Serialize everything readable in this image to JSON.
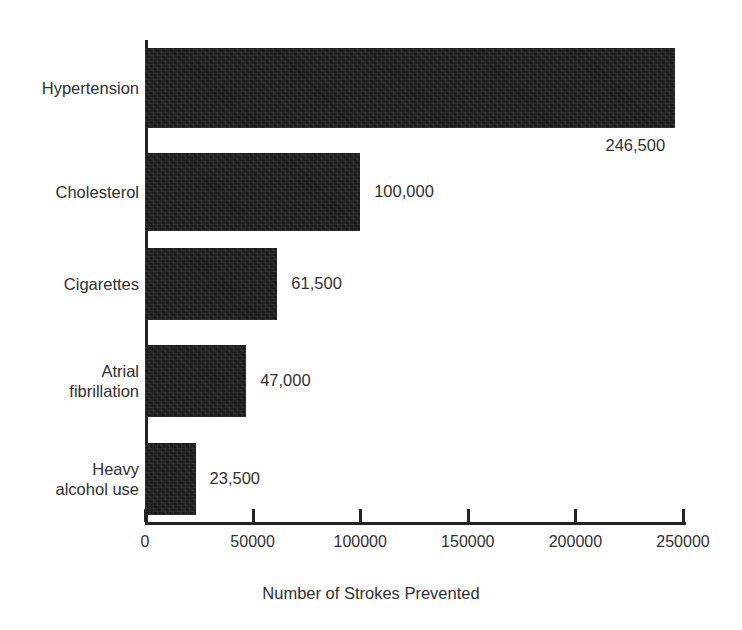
{
  "chart_data": {
    "type": "bar",
    "orientation": "horizontal",
    "title": "",
    "xlabel": "Number of Strokes Prevented",
    "ylabel": "",
    "xlim": [
      0,
      250000
    ],
    "xticks": [
      "0",
      "50000",
      "100000",
      "150000",
      "200000",
      "250000"
    ],
    "xtick_values": [
      0,
      50000,
      100000,
      150000,
      200000,
      250000
    ],
    "grid": false,
    "legend": null,
    "bar_color": "#1a1a1a",
    "categories": [
      "Hypertension",
      "Cholesterol",
      "Cigarettes",
      "Atrial\nfibrillation",
      "Heavy\nalcohol use"
    ],
    "values": [
      246500,
      100000,
      61500,
      47000,
      23500
    ],
    "data_labels": [
      "246,500",
      "100,000",
      "61,500",
      "47,000",
      "23,500"
    ]
  }
}
